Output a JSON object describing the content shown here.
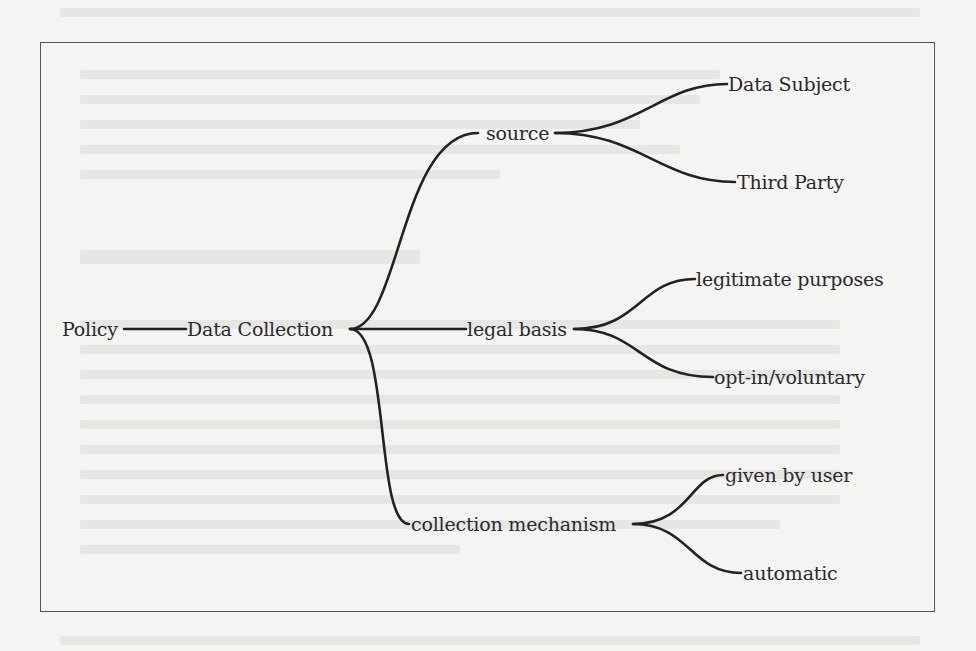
{
  "diagram": {
    "type": "tree",
    "root": "Policy",
    "nodes": {
      "policy": "Policy",
      "data_collection": "Data Collection",
      "source": "source",
      "data_subject": "Data Subject",
      "third_party": "Third Party",
      "legal_basis": "legal basis",
      "legitimate_purposes": "legitimate purposes",
      "opt_in": "opt-in/voluntary",
      "collection_mechanism": "collection mechanism",
      "given_by_user": "given by user",
      "automatic": "automatic"
    },
    "edges": [
      [
        "Policy",
        "Data Collection"
      ],
      [
        "Data Collection",
        "source"
      ],
      [
        "Data Collection",
        "legal basis"
      ],
      [
        "Data Collection",
        "collection mechanism"
      ],
      [
        "source",
        "Data Subject"
      ],
      [
        "source",
        "Third Party"
      ],
      [
        "legal basis",
        "legitimate purposes"
      ],
      [
        "legal basis",
        "opt-in/voluntary"
      ],
      [
        "collection mechanism",
        "given by user"
      ],
      [
        "collection mechanism",
        "automatic"
      ]
    ],
    "line_color": "#222222"
  }
}
